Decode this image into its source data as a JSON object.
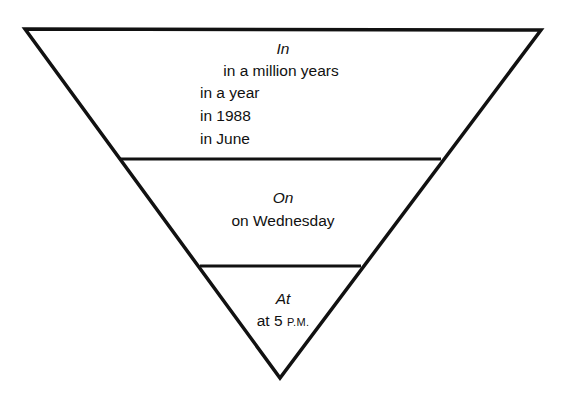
{
  "diagram": {
    "shape": "inverted-triangle",
    "line_color": "#111111",
    "sections": [
      {
        "heading": "In",
        "examples": [
          "in a million years",
          "in a year",
          "in 1988",
          "in June"
        ]
      },
      {
        "heading": "On",
        "examples": [
          "on Wednesday"
        ]
      },
      {
        "heading": "At",
        "examples": [
          "at 5 P.M."
        ],
        "example_parts": {
          "main": "at 5 ",
          "small_caps": "P.M."
        }
      }
    ]
  }
}
